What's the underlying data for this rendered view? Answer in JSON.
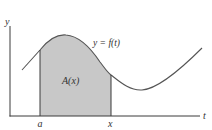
{
  "figure": {
    "y_axis_label": "y",
    "t_axis_label": "t",
    "curve_label": "y = f(t)",
    "area_label": "A(x)",
    "lower_limit_label": "a",
    "upper_limit_label": "x",
    "colors": {
      "axis": "#3a3a3a",
      "curve": "#555555",
      "shaded_area": "#c8c8c8",
      "text": "#333333"
    }
  }
}
